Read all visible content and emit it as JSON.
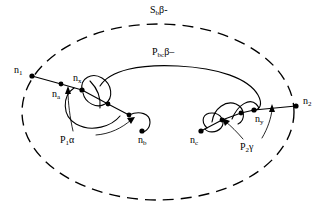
{
  "figure": {
    "type": "graph-path-topology-diagram",
    "background_color": "#ffffff",
    "ink_color": "#000000",
    "width": 328,
    "height": 214
  },
  "boundary": {
    "name": "dashed-ellipse",
    "label_base": "S",
    "label_sub": "b",
    "label_suffix": "β-",
    "label_full": "S₆β-",
    "style": "dashed",
    "cx": 158,
    "cy": 112,
    "rx": 136,
    "ry": 88
  },
  "main_path": {
    "name": "P-bc-beta",
    "label_base": "P",
    "label_sub": "bc",
    "label_suffix": "β–",
    "label_full": "Pᵇᶜβ–"
  },
  "sub_paths": [
    {
      "name": "P1-alpha",
      "label_base": "P",
      "label_sub": "1",
      "label_suffix": "α",
      "label_full": "P₁α"
    },
    {
      "name": "P2-gamma",
      "label_base": "P",
      "label_sub": "2",
      "label_suffix": "γ",
      "label_full": "P₂γ"
    }
  ],
  "nodes": [
    {
      "id": "n1",
      "label_base": "n",
      "label_sub": "1",
      "label_full": "n₁",
      "x": 32,
      "y": 76,
      "label_x": 14,
      "label_y": 66
    },
    {
      "id": "na",
      "label_base": "n",
      "label_sub": "a",
      "label_full": "nₐ",
      "x": 61,
      "y": 84,
      "label_x": 52,
      "label_y": 90
    },
    {
      "id": "nx",
      "label_base": "n",
      "label_sub": "x",
      "label_full": "nₓ",
      "x": 82,
      "y": 90,
      "label_x": 73,
      "label_y": 74
    },
    {
      "id": "nb",
      "label_base": "n",
      "label_sub": "b",
      "label_full": "nᵇ",
      "x": 142,
      "y": 131,
      "label_x": 138,
      "label_y": 136
    },
    {
      "id": "nc",
      "label_base": "n",
      "label_sub": "c",
      "label_full": "nᶜ",
      "x": 201,
      "y": 131,
      "label_x": 190,
      "label_y": 136
    },
    {
      "id": "ny",
      "label_base": "n",
      "label_sub": "y",
      "label_full": "nʸ",
      "x": 254,
      "y": 110,
      "label_x": 255,
      "label_y": 115
    },
    {
      "id": "n2",
      "label_base": "n",
      "label_sub": "2",
      "label_full": "n₂",
      "x": 296,
      "y": 106,
      "label_x": 303,
      "label_y": 97
    }
  ],
  "labels": {
    "boundary_label": {
      "x": 150,
      "y": 6
    },
    "main_path_label": {
      "x": 152,
      "y": 48
    },
    "p1_label": {
      "x": 60,
      "y": 136
    },
    "p2_label": {
      "x": 240,
      "y": 143
    }
  }
}
